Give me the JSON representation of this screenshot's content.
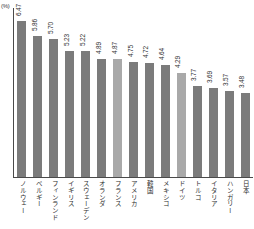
{
  "chart_data": {
    "type": "bar",
    "title": "",
    "subtitle": "",
    "xlabel": "",
    "ylabel": "",
    "unit_label": "(%)",
    "ylim": [
      0,
      7
    ],
    "grid": false,
    "legend": null,
    "orientation": "vertical",
    "value_label_rotation": "vertical",
    "category_label_script": "japanese-vertical",
    "categories": [
      "ノルウェー",
      "ベルギー",
      "フィンランド",
      "イギリス",
      "スウェーデン",
      "オランダ",
      "フランス",
      "アメリカ",
      "韓国",
      "メキシコ",
      "ドイツ",
      "トルコ",
      "イタリア",
      "ハンガリー",
      "日本"
    ],
    "values": [
      6.47,
      5.86,
      5.7,
      5.23,
      5.22,
      4.89,
      4.87,
      4.75,
      4.72,
      4.64,
      4.29,
      3.77,
      3.69,
      3.57,
      3.48
    ],
    "value_labels": [
      "6.47",
      "5.86",
      "5.70",
      "5.23",
      "5.22",
      "4.89",
      "4.87",
      "4.75",
      "4.72",
      "4.64",
      "4.29",
      "3.77",
      "3.69",
      "3.57",
      "3.48"
    ],
    "highlighted_indices": [
      6,
      10
    ],
    "colors": {
      "bar": "#7b7b7b",
      "bar_highlight": "#a9a9a9",
      "axis": "#4a4a4a",
      "text": "#2e2e2e",
      "background": "#ffffff"
    }
  }
}
